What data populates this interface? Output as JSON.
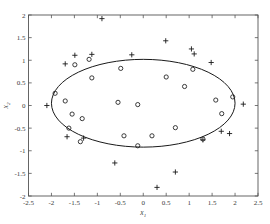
{
  "chart_data": {
    "type": "scatter",
    "title": "",
    "xlabel": "x1",
    "ylabel": "x2",
    "xlabel_base": "x",
    "xlabel_sub": "1",
    "ylabel_base": "x",
    "ylabel_sub": "2",
    "xlim": [
      -2.5,
      2.5
    ],
    "ylim": [
      -2,
      2
    ],
    "grid": false,
    "legend": "none",
    "xticks": [
      -2.5,
      -2,
      -1.5,
      -1,
      -0.5,
      0,
      0.5,
      1,
      1.5,
      2,
      2.5
    ],
    "xticklabels": [
      "-2.5",
      "-2",
      "-1.5",
      "-1",
      "-0.5",
      "0",
      "0.5",
      "1",
      "1.5",
      "2",
      "2.5"
    ],
    "yticks": [
      -2,
      -1.5,
      -1,
      -0.5,
      0,
      0.5,
      1,
      1.5,
      2
    ],
    "yticklabels": [
      "-2",
      "-1.5",
      "-1",
      "-0.5",
      "0",
      "0.5",
      "1",
      "1.5",
      "2"
    ],
    "series": [
      {
        "name": "inliers",
        "marker": "circle",
        "color": "#1a1a1a",
        "points": [
          [
            -1.92,
            0.27
          ],
          [
            -1.7,
            0.1
          ],
          [
            -1.55,
            -0.19
          ],
          [
            -1.62,
            -0.5
          ],
          [
            -1.33,
            -0.29
          ],
          [
            -1.49,
            0.9
          ],
          [
            -1.18,
            1.02
          ],
          [
            -1.37,
            -0.8
          ],
          [
            -1.12,
            0.61
          ],
          [
            -0.49,
            0.82
          ],
          [
            -0.55,
            0.07
          ],
          [
            -0.12,
            0.02
          ],
          [
            -0.12,
            -0.89
          ],
          [
            -0.42,
            -0.67
          ],
          [
            0.19,
            -0.67
          ],
          [
            0.5,
            0.63
          ],
          [
            0.7,
            -0.49
          ],
          [
            0.9,
            0.42
          ],
          [
            1.08,
            0.8
          ],
          [
            1.3,
            -0.74
          ],
          [
            1.58,
            0.12
          ],
          [
            1.71,
            -0.18
          ],
          [
            1.95,
            0.19
          ]
        ]
      },
      {
        "name": "outliers",
        "marker": "plus",
        "color": "#1a1a1a",
        "points": [
          [
            -0.9,
            1.92
          ],
          [
            0.49,
            1.43
          ],
          [
            -1.49,
            1.11
          ],
          [
            -1.7,
            0.92
          ],
          [
            -1.12,
            1.13
          ],
          [
            -0.25,
            1.12
          ],
          [
            1.05,
            1.25
          ],
          [
            1.11,
            1.14
          ],
          [
            1.48,
            0.95
          ],
          [
            -2.1,
            0.0
          ],
          [
            2.18,
            0.03
          ],
          [
            -1.66,
            -0.69
          ],
          [
            -1.3,
            -0.72
          ],
          [
            1.3,
            -0.76
          ],
          [
            1.7,
            -0.57
          ],
          [
            1.88,
            -0.62
          ],
          [
            -0.62,
            -1.27
          ],
          [
            0.7,
            -1.47
          ],
          [
            0.3,
            -1.81
          ]
        ]
      }
    ],
    "boundary": {
      "name": "ellipse-boundary",
      "type": "ellipse",
      "cx": 0.0,
      "cy": 0.05,
      "rx": 2.0,
      "ry": 0.97,
      "rotation": 0
    }
  }
}
